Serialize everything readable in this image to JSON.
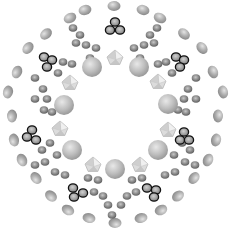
{
  "figure": {
    "description": "Ball-and-stick style rendering of a ring-shaped molecular cluster with approximately 8-fold symmetry",
    "center": [
      115,
      116
    ],
    "colors": {
      "background": "#ffffff",
      "large_sphere": "#b8b8b8",
      "outer_atom": "#a8a8a8",
      "inner_atom": "#8a8a8a",
      "octahedron": "#d8d8d8",
      "trimer_outline": "#111111"
    }
  },
  "large_spheres": [
    [
      92,
      67,
      10
    ],
    [
      139,
      67,
      10
    ],
    [
      64,
      105,
      10
    ],
    [
      168,
      104,
      10
    ],
    [
      72,
      150,
      10
    ],
    [
      158,
      150,
      10
    ],
    [
      115,
      169,
      10
    ]
  ],
  "octahedra": [
    [
      115,
      58,
      8
    ],
    [
      70,
      83,
      8
    ],
    [
      158,
      82,
      8
    ],
    [
      60,
      129,
      8
    ],
    [
      168,
      130,
      8
    ],
    [
      93,
      165,
      8
    ],
    [
      140,
      165,
      8
    ]
  ],
  "trimers": [
    [
      [
        115,
        22
      ],
      [
        110,
        30
      ],
      [
        120,
        30
      ]
    ],
    [
      [
        44,
        57
      ],
      [
        52,
        60
      ],
      [
        47,
        67
      ]
    ],
    [
      [
        176,
        57
      ],
      [
        184,
        60
      ],
      [
        180,
        67
      ]
    ],
    [
      [
        32,
        130
      ],
      [
        27,
        137
      ],
      [
        36,
        140
      ]
    ],
    [
      [
        184,
        132
      ],
      [
        180,
        140
      ],
      [
        189,
        140
      ]
    ],
    [
      [
        73,
        188
      ],
      [
        83,
        193
      ],
      [
        74,
        197
      ]
    ],
    [
      [
        147,
        188
      ],
      [
        156,
        190
      ],
      [
        154,
        197
      ]
    ]
  ],
  "outer_atoms": [
    [
      85,
      10
    ],
    [
      114,
      6
    ],
    [
      143,
      10
    ],
    [
      70,
      18
    ],
    [
      160,
      18
    ],
    [
      46,
      34
    ],
    [
      184,
      34
    ],
    [
      28,
      48
    ],
    [
      202,
      48
    ],
    [
      17,
      72
    ],
    [
      213,
      72
    ],
    [
      8,
      92
    ],
    [
      223,
      92
    ],
    [
      12,
      116
    ],
    [
      218,
      116
    ],
    [
      14,
      140
    ],
    [
      216,
      140
    ],
    [
      22,
      160
    ],
    [
      208,
      160
    ],
    [
      36,
      178
    ],
    [
      194,
      178
    ],
    [
      51,
      196
    ],
    [
      178,
      196
    ],
    [
      68,
      210
    ],
    [
      161,
      210
    ],
    [
      89,
      218
    ],
    [
      115,
      223
    ],
    [
      141,
      218
    ]
  ],
  "mid_atoms": [
    [
      73,
      28
    ],
    [
      80,
      35
    ],
    [
      76,
      43
    ],
    [
      86,
      45
    ],
    [
      96,
      48
    ],
    [
      90,
      58
    ],
    [
      157,
      28
    ],
    [
      150,
      35
    ],
    [
      154,
      43
    ],
    [
      144,
      45
    ],
    [
      134,
      48
    ],
    [
      140,
      58
    ],
    [
      63,
      62
    ],
    [
      72,
      64
    ],
    [
      58,
      73
    ],
    [
      166,
      62
    ],
    [
      158,
      64
    ],
    [
      172,
      73
    ],
    [
      35,
      78
    ],
    [
      43,
      89
    ],
    [
      47,
      99
    ],
    [
      35,
      99
    ],
    [
      196,
      78
    ],
    [
      188,
      89
    ],
    [
      184,
      99
    ],
    [
      196,
      99
    ],
    [
      44,
      110
    ],
    [
      52,
      112
    ],
    [
      178,
      110
    ],
    [
      186,
      112
    ],
    [
      42,
      150
    ],
    [
      50,
      143
    ],
    [
      57,
      155
    ],
    [
      190,
      150
    ],
    [
      182,
      143
    ],
    [
      174,
      155
    ],
    [
      45,
      162
    ],
    [
      35,
      165
    ],
    [
      185,
      162
    ],
    [
      195,
      165
    ],
    [
      55,
      172
    ],
    [
      65,
      175
    ],
    [
      175,
      172
    ],
    [
      165,
      175
    ],
    [
      88,
      178
    ],
    [
      98,
      180
    ],
    [
      94,
      192
    ],
    [
      103,
      196
    ],
    [
      142,
      178
    ],
    [
      132,
      180
    ],
    [
      136,
      192
    ],
    [
      127,
      196
    ],
    [
      108,
      205
    ],
    [
      121,
      205
    ],
    [
      112,
      215
    ]
  ]
}
